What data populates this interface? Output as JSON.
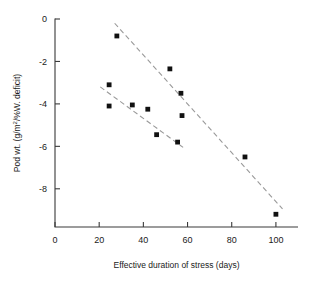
{
  "chart_data": {
    "type": "scatter",
    "title": "",
    "xlabel": "Effective duration of stress (days)",
    "ylabel": "Pod wt. (g/m²/%W. deficit)",
    "ylabel_parts": {
      "prefix": "Pod wt. (g/m",
      "superscript": "2",
      "suffix": "/%W. deficit)"
    },
    "xlim": [
      0,
      110
    ],
    "ylim": [
      -9.8,
      0
    ],
    "xticks": [
      0,
      20,
      40,
      60,
      80,
      100
    ],
    "xtick_labels": [
      "0",
      "20",
      "40",
      "60",
      "80",
      "100"
    ],
    "yticks": [
      0,
      -2,
      -4,
      -6,
      -8
    ],
    "ytick_labels": [
      "0",
      "-2",
      "-4",
      "-6",
      "-8"
    ],
    "grid": false,
    "legend": "none",
    "marker": "filled-square",
    "marker_color": "#111111",
    "fit_line_color": "#9a9a9a",
    "fit_line_style": "dashed",
    "axis_color": "#3a3a3a",
    "background": "#ffffff",
    "series": [
      {
        "name": "upper-group",
        "points": [
          {
            "x": 28,
            "y": -0.8
          },
          {
            "x": 52,
            "y": -2.35
          },
          {
            "x": 57,
            "y": -3.5
          },
          {
            "x": 57.5,
            "y": -4.55
          },
          {
            "x": 86,
            "y": -6.5
          },
          {
            "x": 100,
            "y": -9.2
          }
        ],
        "fit": {
          "x1": 27,
          "y1": -0.2,
          "x2": 103,
          "y2": -8.95
        }
      },
      {
        "name": "lower-group",
        "points": [
          {
            "x": 24.5,
            "y": -3.1
          },
          {
            "x": 24.5,
            "y": -4.1
          },
          {
            "x": 35,
            "y": -4.05
          },
          {
            "x": 42,
            "y": -4.25
          },
          {
            "x": 46,
            "y": -5.45
          },
          {
            "x": 55.5,
            "y": -5.8
          }
        ],
        "fit": {
          "x1": 20.5,
          "y1": -3.2,
          "x2": 58,
          "y2": -6.05
        }
      }
    ]
  }
}
